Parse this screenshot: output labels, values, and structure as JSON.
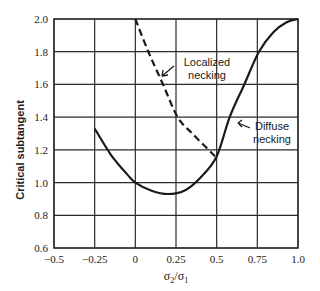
{
  "chart_data": {
    "type": "line",
    "title": "",
    "xlabel": "σ2/σ1",
    "ylabel": "Critical subtangent",
    "xlim": [
      -0.5,
      1.0
    ],
    "ylim": [
      0.6,
      2.0
    ],
    "grid": true,
    "legend": "none (inline annotations)",
    "x_ticks": [
      -0.5,
      -0.25,
      0,
      0.25,
      0.5,
      0.75,
      1.0
    ],
    "x_tick_labels": [
      "−0.5",
      "−0.25",
      "0",
      "0.25",
      "0.5",
      "0.75",
      "1.0"
    ],
    "y_ticks": [
      0.6,
      0.8,
      1.0,
      1.2,
      1.4,
      1.6,
      1.8,
      2.0
    ],
    "y_tick_labels": [
      "0.6",
      "0.8",
      "1.0",
      "1.2",
      "1.4",
      "1.6",
      "1.8",
      "2.0"
    ],
    "series": [
      {
        "name": "Diffuse necking",
        "style": "solid",
        "x": [
          -0.25,
          -0.15,
          -0.05,
          0.0,
          0.1,
          0.2,
          0.3,
          0.4,
          0.5,
          0.58,
          0.67,
          0.76,
          0.85,
          0.93,
          1.0
        ],
        "y": [
          1.33,
          1.17,
          1.05,
          1.0,
          0.95,
          0.93,
          0.95,
          1.03,
          1.16,
          1.4,
          1.6,
          1.8,
          1.92,
          1.98,
          2.0
        ]
      },
      {
        "name": "Localized necking",
        "style": "dashed",
        "x": [
          0.0,
          0.08,
          0.17,
          0.26,
          0.35,
          0.45,
          0.49
        ],
        "y": [
          2.0,
          1.8,
          1.6,
          1.4,
          1.3,
          1.2,
          1.16
        ]
      }
    ],
    "annotations": [
      {
        "text_lines": [
          "Localized",
          "necking"
        ],
        "points_to": "Localized necking"
      },
      {
        "text_lines": [
          "Diffuse",
          "necking"
        ],
        "points_to": "Diffuse necking"
      }
    ]
  },
  "labels": {
    "ylabel": "Critical subtangent",
    "xlabel_main": "σ",
    "xlabel_sub1": "2",
    "xlabel_slash": "/σ",
    "xlabel_sub2": "1",
    "localized_line1": "Localized",
    "localized_line2": "necking",
    "diffuse_line1": "Diffuse",
    "diffuse_line2": "necking"
  },
  "colors": {
    "line": "#1a1a1a",
    "grid": "#2a2a2a",
    "background": "#ffffff"
  }
}
